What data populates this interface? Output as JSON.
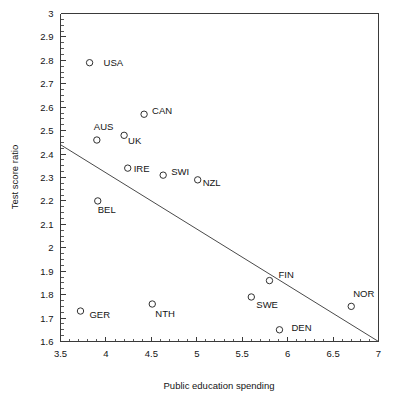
{
  "chart_data": {
    "type": "scatter",
    "title": "",
    "xlabel": "Public education spending",
    "ylabel": "Test score ratio",
    "xlim": [
      3.5,
      7.0
    ],
    "ylim": [
      1.6,
      3.0
    ],
    "grid": false,
    "legend": "none",
    "x_major_step": 0.5,
    "x_minor_step": 0.1,
    "y_major_step": 0.1,
    "xticks": [
      "3.5",
      "4",
      "4.5",
      "5",
      "5.5",
      "6",
      "6.5",
      "7"
    ],
    "xtick_values": [
      3.5,
      4,
      4.5,
      5,
      5.5,
      6,
      6.5,
      7
    ],
    "yticks": [
      "1.6",
      "1.7",
      "1.8",
      "1.9",
      "2",
      "2.1",
      "2.2",
      "2.3",
      "2.4",
      "2.5",
      "2.6",
      "2.7",
      "2.8",
      "2.9",
      "3"
    ],
    "ytick_values": [
      1.6,
      1.7,
      1.8,
      1.9,
      2.0,
      2.1,
      2.2,
      2.3,
      2.4,
      2.5,
      2.6,
      2.7,
      2.8,
      2.9,
      3.0
    ],
    "points": [
      {
        "label": "USA",
        "x": 3.82,
        "y": 2.79,
        "label_dx": 14,
        "label_dy": 3
      },
      {
        "label": "AUS",
        "x": 3.9,
        "y": 2.46,
        "label_dx": -3,
        "label_dy": -10
      },
      {
        "label": "CAN",
        "x": 4.42,
        "y": 2.57,
        "label_dx": 8,
        "label_dy": 0
      },
      {
        "label": "UK",
        "x": 4.2,
        "y": 2.48,
        "label_dx": 4,
        "label_dy": 9
      },
      {
        "label": "IRE",
        "x": 4.24,
        "y": 2.34,
        "label_dx": 6,
        "label_dy": 4
      },
      {
        "label": "SWI",
        "x": 4.63,
        "y": 2.31,
        "label_dx": 8,
        "label_dy": 0
      },
      {
        "label": "NZL",
        "x": 5.01,
        "y": 2.29,
        "label_dx": 5,
        "label_dy": 6
      },
      {
        "label": "BEL",
        "x": 3.91,
        "y": 2.2,
        "label_dx": 0,
        "label_dy": 12
      },
      {
        "label": "GER",
        "x": 3.72,
        "y": 1.73,
        "label_dx": 9,
        "label_dy": 7
      },
      {
        "label": "NTH",
        "x": 4.51,
        "y": 1.76,
        "label_dx": 3,
        "label_dy": 13
      },
      {
        "label": "SWE",
        "x": 5.6,
        "y": 1.79,
        "label_dx": 5,
        "label_dy": 11
      },
      {
        "label": "FIN",
        "x": 5.8,
        "y": 1.86,
        "label_dx": 9,
        "label_dy": -3
      },
      {
        "label": "DEN",
        "x": 5.91,
        "y": 1.65,
        "label_dx": 12,
        "label_dy": 1
      },
      {
        "label": "NOR",
        "x": 6.7,
        "y": 1.75,
        "label_dx": 2,
        "label_dy": -9
      }
    ],
    "fit_line": {
      "x1": 3.5,
      "y1": 2.44,
      "x2": 7.0,
      "y2": 1.6
    }
  },
  "colors": {
    "axis": "#3a3a3a",
    "marker": "#303030",
    "text": "#141414",
    "fit_line": "#4a4a4a",
    "background": "#ffffff"
  }
}
